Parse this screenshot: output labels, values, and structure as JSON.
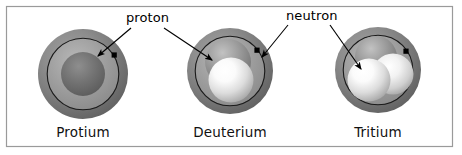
{
  "figure": {
    "background_color": "#ffffff",
    "frame_color": "#9a9a9a",
    "annotations": {
      "proton_label": "proton",
      "neutron_label": "neutron"
    },
    "atoms": [
      {
        "name": "protium",
        "caption": "Protium",
        "cx": 83,
        "cy": 74,
        "cloud_radius": 45,
        "orbit_radius": 36,
        "nucleus": [
          {
            "part": "proton",
            "cx": 83,
            "cy": 74,
            "r": 22,
            "color": "#6e6e6e",
            "highlight": "#8c8c8c"
          }
        ],
        "electron": {
          "cx": 114,
          "cy": 55,
          "size": 5,
          "color": "#000000"
        }
      },
      {
        "name": "deuterium",
        "caption": "Deuterium",
        "cx": 230,
        "cy": 71,
        "cloud_radius": 43,
        "orbit_radius": 35,
        "nucleus": [
          {
            "part": "neutron",
            "cx": 228,
            "cy": 64,
            "r": 23,
            "color": "#8e8e8e",
            "highlight": "#b4b4b4"
          },
          {
            "part": "proton",
            "cx": 231,
            "cy": 79,
            "r": 23,
            "color": "#e9e9e9",
            "highlight": "#ffffff"
          }
        ],
        "electron": {
          "cx": 257,
          "cy": 50,
          "size": 5,
          "color": "#000000"
        }
      },
      {
        "name": "tritium",
        "caption": "Tritium",
        "cx": 378,
        "cy": 70,
        "cloud_radius": 43,
        "orbit_radius": 35,
        "nucleus": [
          {
            "part": "neutron",
            "cx": 375,
            "cy": 58,
            "r": 21,
            "color": "#8a8a8a",
            "highlight": "#ababab"
          },
          {
            "part": "neutron",
            "cx": 392,
            "cy": 74,
            "r": 21,
            "color": "#dedede",
            "highlight": "#ffffff"
          },
          {
            "part": "proton",
            "cx": 368,
            "cy": 80,
            "r": 22,
            "color": "#e4e4e4",
            "highlight": "#ffffff"
          }
        ],
        "electron": {
          "cx": 406,
          "cy": 51,
          "size": 5,
          "color": "#000000"
        }
      }
    ],
    "colors": {
      "electron_cloud_outer": "#707070",
      "electron_cloud_inner": "#a8a8a8",
      "orbit_stroke": "#1a1a1a",
      "text": "#111111",
      "leader": "#000000"
    }
  }
}
